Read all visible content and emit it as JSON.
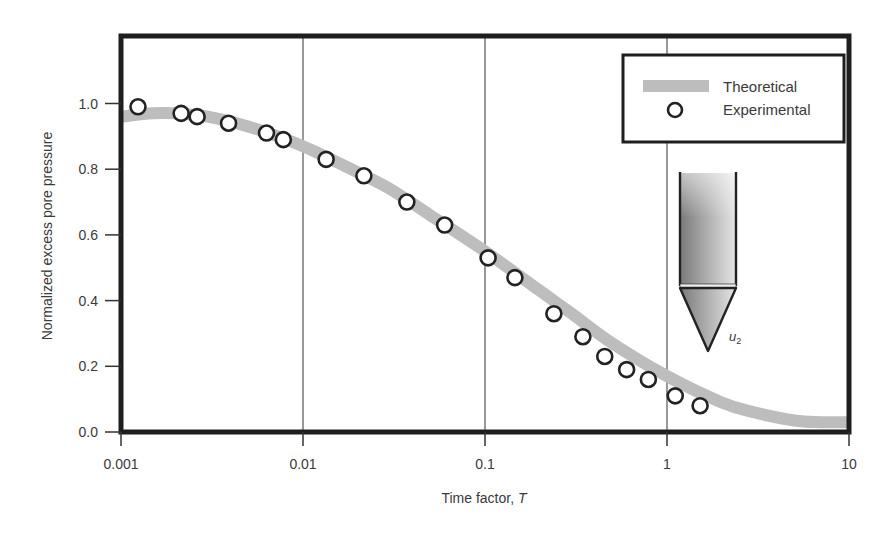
{
  "chart_data": {
    "type": "scatter",
    "title": "",
    "xlabel": "Time factor, T",
    "xlabel_main": "Time factor, ",
    "xlabel_var": "T",
    "ylabel": "Normalized excess pore pressure",
    "xscale": "log",
    "xlim": [
      0.001,
      10
    ],
    "ylim": [
      0.0,
      1.18
    ],
    "x_ticks": [
      0.001,
      0.01,
      0.1,
      1,
      10
    ],
    "x_tick_labels": [
      "0.001",
      "0.01",
      "0.1",
      "1",
      "10"
    ],
    "y_ticks": [
      0.0,
      0.2,
      0.4,
      0.6,
      0.8,
      1.0
    ],
    "y_tick_labels": [
      "0.0",
      "0.2",
      "0.4",
      "0.6",
      "0.8",
      "1.0"
    ],
    "grid": "vertical lines at decades",
    "legend_position": "upper right",
    "series": [
      {
        "name": "Theoretical",
        "style": "thick gray line",
        "color": "#bdbdbd",
        "x": [
          0.001,
          0.0015,
          0.002,
          0.003,
          0.005,
          0.01,
          0.02,
          0.03,
          0.05,
          0.1,
          0.2,
          0.3,
          0.5,
          1,
          2,
          3,
          5,
          7,
          10
        ],
        "y": [
          0.96,
          0.97,
          0.97,
          0.96,
          0.93,
          0.87,
          0.79,
          0.74,
          0.66,
          0.55,
          0.43,
          0.36,
          0.27,
          0.17,
          0.09,
          0.06,
          0.035,
          0.03,
          0.03
        ]
      },
      {
        "name": "Experimental",
        "style": "open circle markers",
        "color": "#222222",
        "x": [
          0.00124,
          0.00214,
          0.00262,
          0.0039,
          0.0063,
          0.0078,
          0.0134,
          0.0216,
          0.0372,
          0.06,
          0.104,
          0.146,
          0.239,
          0.345,
          0.455,
          0.6,
          0.79,
          1.11,
          1.52
        ],
        "y": [
          0.99,
          0.97,
          0.96,
          0.94,
          0.91,
          0.89,
          0.83,
          0.78,
          0.7,
          0.63,
          0.53,
          0.47,
          0.36,
          0.29,
          0.23,
          0.19,
          0.16,
          0.11,
          0.08
        ]
      }
    ],
    "annotations": [
      {
        "type": "cone-penetrometer-probe-illustration",
        "label": "u",
        "subscript": "2"
      }
    ]
  },
  "legend": {
    "items": [
      {
        "label": "Theoretical"
      },
      {
        "label": "Experimental"
      }
    ]
  },
  "probe": {
    "label": "u",
    "subscript": "2"
  }
}
